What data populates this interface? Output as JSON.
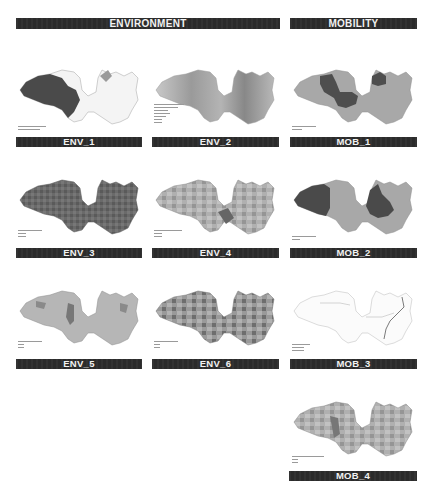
{
  "sections": {
    "environment": "ENVIRONMENT",
    "mobility": "MOBILITY"
  },
  "panels": [
    {
      "id": "env1",
      "label": "ENV_1",
      "style": "highlight-west",
      "legend_rows": 2
    },
    {
      "id": "env2",
      "label": "ENV_2",
      "style": "gradient",
      "legend_rows": 7
    },
    {
      "id": "mob1",
      "label": "MOB_1",
      "style": "two-dark",
      "legend_rows": 2
    },
    {
      "id": "env3",
      "label": "ENV_3",
      "style": "dark-fine",
      "legend_rows": 5
    },
    {
      "id": "env4",
      "label": "ENV_4",
      "style": "mixed-mid",
      "legend_rows": 5
    },
    {
      "id": "mob2",
      "label": "MOB_2",
      "style": "two-dark-b",
      "legend_rows": 3
    },
    {
      "id": "env5",
      "label": "ENV_5",
      "style": "light-patchy",
      "legend_rows": 5
    },
    {
      "id": "env6",
      "label": "ENV_6",
      "style": "mixed-dark",
      "legend_rows": 5
    },
    {
      "id": "mob3",
      "label": "MOB_3",
      "style": "outline-network",
      "legend_rows": 6
    },
    {
      "id": "mob4",
      "label": "MOB_4",
      "style": "mixed-mid",
      "legend_rows": 5
    }
  ],
  "colors": {
    "banner": "#2b2b2b",
    "banner_text": "#f2f2f2",
    "map_light": "#d4d4d4",
    "map_mid": "#a8a8a8",
    "map_dark": "#5a5a5a",
    "map_outline": "#8c8c8c"
  }
}
